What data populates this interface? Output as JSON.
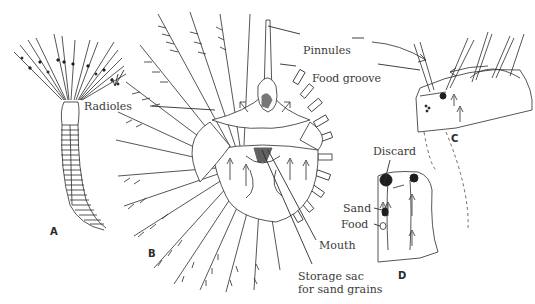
{
  "figure": {
    "panels": [
      {
        "id": "A",
        "label": "A",
        "description": "whole fan worm with radioles"
      },
      {
        "id": "B",
        "label": "B",
        "description": "crown of radioles, front view"
      },
      {
        "id": "C",
        "label": "C",
        "description": "section of radiole with pinnules and food groove"
      },
      {
        "id": "D",
        "label": "D",
        "description": "base of crown sorting particles"
      }
    ],
    "labels": {
      "radioles": "Radioles",
      "pinnules": "Pinnules",
      "food_groove": "Food groove",
      "mouth": "Mouth",
      "storage_sac_line1": "Storage sac",
      "storage_sac_line2": "for sand grains",
      "discard": "Discard",
      "sand": "Sand",
      "food": "Food"
    },
    "colors": {
      "ink": "#2b2b2b",
      "background": "#ffffff",
      "label_text": "#3a3a3a"
    }
  }
}
